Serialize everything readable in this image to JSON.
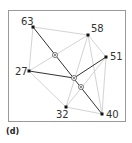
{
  "caption": "(d)",
  "colors": {
    "frame": "#9a9a9a",
    "light_edge": "#c8c8c8",
    "dark_edge": "#333333",
    "node": "#111111",
    "marker": "#555555"
  },
  "nodes": [
    {
      "id": "63",
      "label": "63"
    },
    {
      "id": "58",
      "label": "58"
    },
    {
      "id": "51",
      "label": "51"
    },
    {
      "id": "27",
      "label": "27"
    },
    {
      "id": "32",
      "label": "32"
    },
    {
      "id": "40",
      "label": "40"
    }
  ],
  "light_edges": [
    [
      "63",
      "58"
    ],
    [
      "63",
      "27"
    ],
    [
      "58",
      "51"
    ],
    [
      "58",
      "27"
    ],
    [
      "58",
      "32"
    ],
    [
      "51",
      "40"
    ],
    [
      "51",
      "32"
    ],
    [
      "27",
      "32"
    ],
    [
      "32",
      "40"
    ],
    [
      "58",
      "40"
    ]
  ],
  "dark_edges": [
    [
      "63",
      "40"
    ],
    [
      "27",
      "c"
    ],
    [
      "c",
      "51"
    ]
  ],
  "markers": [
    "m1",
    "c",
    "m2"
  ]
}
